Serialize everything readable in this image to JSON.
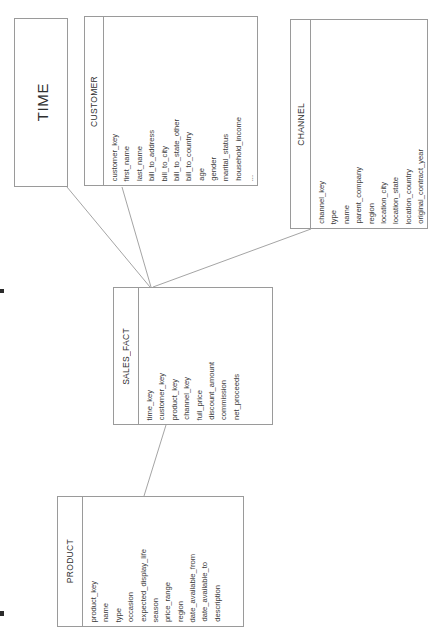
{
  "diagram": {
    "type": "star-schema",
    "title_visible": false,
    "orientation": "rotated-90-ccw",
    "line_color": "#9a9a9a",
    "box_border_color": "#9a9a9a",
    "background": "#ffffff",
    "text_color": "#3a3a3a"
  },
  "entities": [
    {
      "id": "time",
      "name": "TIME",
      "role": "dimension",
      "fields": []
    },
    {
      "id": "customer",
      "name": "CUSTOMER",
      "role": "dimension",
      "fields": [
        "customer_key",
        "first_name",
        "last_name",
        "bill_to_address",
        "bill_to_city",
        "bill_to_state_other",
        "bill_to_country",
        "age",
        "gender",
        "marital_status",
        "household_income",
        "..."
      ]
    },
    {
      "id": "channel",
      "name": "CHANNEL",
      "role": "dimension",
      "fields": [
        "channel_key",
        "type",
        "name",
        "parent_company",
        "region",
        "location_city",
        "location_state",
        "location_country",
        "original_contract_year"
      ]
    },
    {
      "id": "sales_fact",
      "name": "SALES_FACT",
      "role": "fact",
      "fields": [
        "time_key",
        "customer_key",
        "product_key",
        "channel_key",
        "full_price",
        "discount_amount",
        "commission",
        "net_proceeds"
      ]
    },
    {
      "id": "product",
      "name": "PRODUCT",
      "role": "dimension",
      "fields": [
        "product_key",
        "name",
        "type",
        "occasion",
        "expected_display_life",
        "season",
        "price_range",
        "region",
        "date_available_from",
        "date_available_to",
        "description"
      ]
    }
  ],
  "relationships": [
    {
      "from": "time",
      "to": "sales_fact"
    },
    {
      "from": "customer",
      "to": "sales_fact"
    },
    {
      "from": "channel",
      "to": "sales_fact"
    },
    {
      "from": "product",
      "to": "sales_fact"
    }
  ]
}
